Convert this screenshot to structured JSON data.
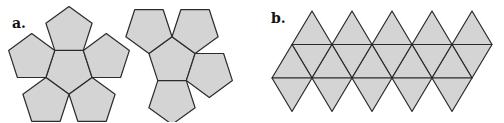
{
  "figure": {
    "panels": [
      {
        "id": "a",
        "label": "a.",
        "description": "Net of a dodecahedron (12 regular pentagons)",
        "face_count": 12,
        "face_shape": "pentagon"
      },
      {
        "id": "b",
        "label": "b.",
        "description": "Net of an icosahedron (20 equilateral triangles)",
        "face_count": 20,
        "face_shape": "triangle"
      }
    ],
    "colors": {
      "face_fill": "#d4d4d4",
      "edge_stroke": "#2b2b2b",
      "background": "#ffffff"
    }
  }
}
